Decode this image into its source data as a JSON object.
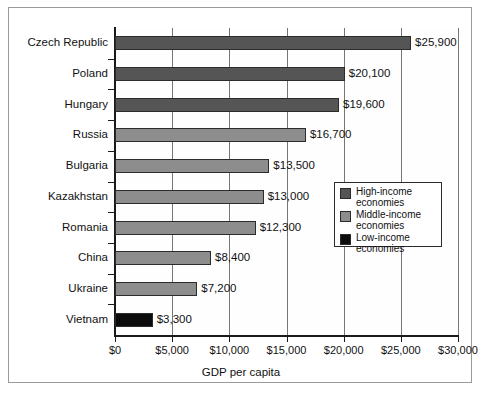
{
  "chart_data": {
    "type": "bar",
    "orientation": "horizontal",
    "title": "",
    "xlabel": "GDP per capita",
    "ylabel": "",
    "xlim": [
      0,
      30000
    ],
    "grid": true,
    "legend_position": "inside-right",
    "categories": [
      "Czech Republic",
      "Poland",
      "Hungary",
      "Russia",
      "Bulgaria",
      "Kazakhstan",
      "Romania",
      "China",
      "Ukraine",
      "Vietnam"
    ],
    "values": [
      25900,
      20100,
      19600,
      16700,
      13500,
      13000,
      12300,
      8400,
      7200,
      3300
    ],
    "value_labels": [
      "$25,900",
      "$20,100",
      "$19,600",
      "$16,700",
      "$13,500",
      "$13,000",
      "$12,300",
      "$8,400",
      "$7,200",
      "$3,300"
    ],
    "groups": [
      "high",
      "high",
      "high",
      "middle",
      "middle",
      "middle",
      "middle",
      "middle",
      "middle",
      "low"
    ],
    "xticks": [
      0,
      5000,
      10000,
      15000,
      20000,
      25000,
      30000
    ],
    "xtick_labels": [
      "$0",
      "$5,000",
      "$10,000",
      "$15,000",
      "$20,000",
      "$25,000",
      "$30,000"
    ],
    "legend": [
      {
        "key": "high",
        "label": "High-income\neconomies",
        "color": "#555555"
      },
      {
        "key": "middle",
        "label": "Middle-income\neconomies",
        "color": "#8d8d8d"
      },
      {
        "key": "low",
        "label": "Low-income\neconomies",
        "color": "#0c0c0c"
      }
    ],
    "legend_lines": [
      [
        "High-income",
        "economies"
      ],
      [
        "Middle-income",
        "economies"
      ],
      [
        "Low-income",
        "economies"
      ]
    ],
    "colors": {
      "high_income": "#555555",
      "middle_income": "#8d8d8d",
      "low_income": "#0c0c0c",
      "axis": "#1a1a1a",
      "gridline": "#767676",
      "frame": "#9a9a9a",
      "plot_background": "#fefefe",
      "text": "#111111"
    }
  }
}
